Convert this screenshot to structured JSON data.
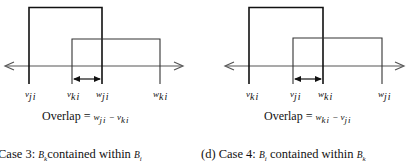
{
  "panels": [
    {
      "id": "case3",
      "labels": [
        {
          "base": "v",
          "sub": "ji",
          "x": 26
        },
        {
          "base": "v",
          "sub": "ki",
          "x": 68
        },
        {
          "base": "w",
          "sub": "ji",
          "x": 97
        },
        {
          "base": "w",
          "sub": "ki",
          "x": 154
        }
      ],
      "overlap": {
        "prefix": "Overlap = ",
        "a_base": "w",
        "a_sub": "ji",
        "op": " − ",
        "b_base": "v",
        "b_sub": "ki"
      },
      "caption": {
        "prefix": "Case 3: ",
        "b1_base": "B",
        "b1_sub": "k",
        "middle": "contained within ",
        "b2_base": "B",
        "b2_sub": "i"
      }
    },
    {
      "id": "case4",
      "labels": [
        {
          "base": "v",
          "sub": "ki",
          "x": 247
        },
        {
          "base": "v",
          "sub": "ji",
          "x": 291
        },
        {
          "base": "w",
          "sub": "ki",
          "x": 319
        },
        {
          "base": "w",
          "sub": "ji",
          "x": 379
        }
      ],
      "overlap": {
        "prefix": "Overlap = ",
        "a_base": "w",
        "a_sub": "ki",
        "op": " − ",
        "b_base": "v",
        "b_sub": "ji"
      },
      "caption": {
        "prefix": "(d) Case 4: ",
        "b1_base": "B",
        "b1_sub": "i",
        "middle": " contained within ",
        "b2_base": "B",
        "b2_sub": "k"
      }
    }
  ]
}
